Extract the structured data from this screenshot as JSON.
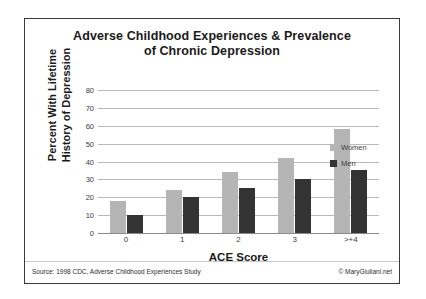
{
  "chart_data": {
    "type": "bar",
    "title": "Adverse Childhood Experiences & Prevalence of Chronic Depression",
    "title_lines": [
      "Adverse Childhood Experiences & Prevalence",
      "of Chronic Depression"
    ],
    "categories": [
      "0",
      "1",
      "2",
      "3",
      ">+4"
    ],
    "series": [
      {
        "name": "Women",
        "color": "#b5b5b5",
        "values": [
          18,
          24,
          34,
          42,
          58
        ]
      },
      {
        "name": "Men",
        "color": "#333333",
        "values": [
          10,
          20,
          25,
          30,
          35
        ]
      }
    ],
    "xlabel": "ACE Score",
    "ylabel": "Percent With Lifetime History of Depression",
    "ylabel_lines": [
      "Percent With Lifetime",
      "History of Depression"
    ],
    "ylim": [
      0,
      80
    ],
    "yticks": [
      80,
      70,
      60,
      50,
      40,
      30,
      20,
      10,
      0
    ],
    "grid": true,
    "legend_position": "right"
  },
  "footer": {
    "source": "Source: 1998 CDC, Adverse Childhood Experiences Study",
    "copyright": "© MaryGiuliani.net"
  }
}
